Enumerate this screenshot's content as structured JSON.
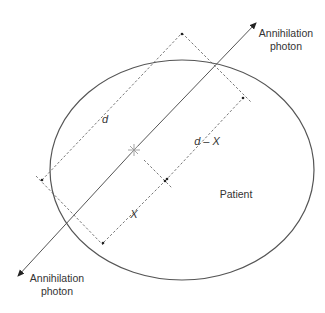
{
  "diagram": {
    "labels": {
      "photon_top_line1": "Annihilation",
      "photon_top_line2": "photon",
      "photon_bottom_line1": "Annihilation",
      "photon_bottom_line2": "photon",
      "patient": "Patient",
      "d": "d",
      "d_minus_x": "d – X",
      "x": "X"
    },
    "colors": {
      "stroke": "#555555",
      "text": "#333333",
      "background": "#ffffff"
    }
  }
}
